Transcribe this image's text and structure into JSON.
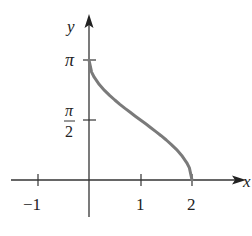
{
  "chart_data": {
    "type": "line",
    "title": "",
    "xlabel": "x",
    "ylabel": "y",
    "function": "y = arccos(x - 1)",
    "x_ticks": [
      {
        "value": -1,
        "label": "−1"
      },
      {
        "value": 1,
        "label": "1"
      },
      {
        "value": 2,
        "label": "2"
      }
    ],
    "y_ticks": [
      {
        "value": 1.5708,
        "label_num": "π",
        "label_den": "2"
      },
      {
        "value": 3.1416,
        "label": "π"
      }
    ],
    "xlim": [
      -1.5,
      3.0
    ],
    "ylim": [
      -0.7,
      3.9
    ],
    "grid": false,
    "series": [
      {
        "name": "arccos(x-1)",
        "color": "#7a7a7a",
        "x": [
          0,
          0.05,
          0.1,
          0.2,
          0.3,
          0.4,
          0.5,
          0.6,
          0.7,
          0.8,
          0.9,
          1.0,
          1.1,
          1.2,
          1.3,
          1.4,
          1.5,
          1.6,
          1.7,
          1.8,
          1.9,
          1.95,
          2.0
        ],
        "values": [
          3.1416,
          2.824,
          2.6906,
          2.4981,
          2.3462,
          2.2143,
          2.0944,
          1.9823,
          1.8755,
          1.7722,
          1.671,
          1.5708,
          1.4706,
          1.3694,
          1.2661,
          1.1593,
          1.0472,
          0.9273,
          0.7954,
          0.6435,
          0.451,
          0.3176,
          0.0
        ]
      }
    ]
  },
  "labels": {
    "x_axis": "x",
    "y_axis": "y",
    "tick_neg1": "−1",
    "tick_1": "1",
    "tick_2": "2",
    "tick_pi": "π",
    "tick_pi_half_num": "π",
    "tick_pi_half_den": "2"
  }
}
